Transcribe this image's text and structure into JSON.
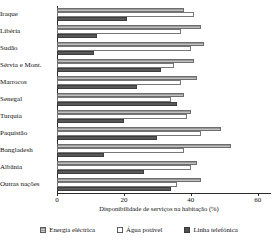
{
  "chart_data": {
    "type": "bar",
    "orientation": "horizontal",
    "title": "",
    "xlabel": "Disponibilidade de serviços na habitação (%)",
    "ylabel": "",
    "xlim": [
      0,
      64
    ],
    "grid": false,
    "legend_position": "bottom",
    "xticks": [
      0,
      20,
      40,
      60
    ],
    "xtick_labels": [
      "0",
      "20",
      "40",
      "60"
    ],
    "categories": [
      "Iraque",
      "Libéria",
      "Sudão",
      "Sérvia e Mont.",
      "Marrocos",
      "Senegal",
      "Turquia",
      "Paquistão",
      "Bangladesh",
      "Albânia",
      "Outras nações"
    ],
    "series": [
      {
        "name": "Energia eléctrica",
        "color": "#9a9a9a",
        "values": [
          38,
          43,
          44,
          41,
          42,
          38,
          40,
          49,
          52,
          42,
          43
        ]
      },
      {
        "name": "Água potável",
        "color": "#ffffff",
        "values": [
          41,
          37,
          40,
          35,
          37,
          34,
          39,
          43,
          38,
          40,
          36
        ]
      },
      {
        "name": "Linha telefónica",
        "color": "#585858",
        "values": [
          21,
          12,
          11,
          31,
          24,
          36,
          20,
          30,
          14,
          26,
          34
        ]
      }
    ]
  },
  "legend": {
    "entries": [
      {
        "label": "Energia eléctrica",
        "swatch": "hatched-grey-swatch"
      },
      {
        "label": "Água potável",
        "swatch": "white-swatch"
      },
      {
        "label": "Linha telefónica",
        "swatch": "dark-grey-swatch"
      }
    ]
  }
}
